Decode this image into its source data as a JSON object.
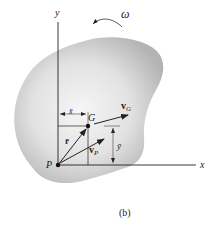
{
  "figure": {
    "caption": "(b)",
    "colors": {
      "body_fill_center": "#f4f4f4",
      "body_fill_edge": "#b9b9b9",
      "line": "#222222"
    },
    "axes": {
      "x_label": "x",
      "y_label": "y"
    },
    "angular_velocity": {
      "symbol": "ω",
      "direction": "counterclockwise"
    },
    "points": {
      "P": {
        "label": "P"
      },
      "G": {
        "label": "G"
      }
    },
    "vectors": {
      "r_bar": {
        "label": "r̄"
      },
      "v_G": {
        "label": "v",
        "subscript": "G"
      },
      "v_P": {
        "label": "v",
        "subscript": "P"
      }
    },
    "dimensions": {
      "x_bar": "x̄",
      "y_bar": "ȳ"
    }
  }
}
